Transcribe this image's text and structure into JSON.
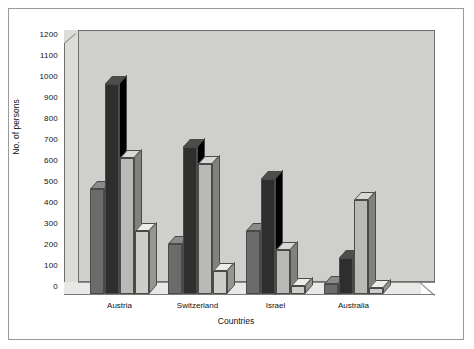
{
  "chart_data": {
    "type": "bar",
    "title": "",
    "xlabel": "Countries",
    "ylabel": "No. of persons",
    "categories": [
      "Austria",
      "Switzerland",
      "Israel",
      "Australia"
    ],
    "ylim": [
      0,
      1200
    ],
    "yticks": [
      0,
      100,
      200,
      300,
      400,
      500,
      600,
      700,
      800,
      900,
      1000,
      1100,
      1200
    ],
    "grid": false,
    "legend": "none",
    "style": "3d-clustered-column",
    "series": [
      {
        "name": "Series 1",
        "color": "#6b6b6b",
        "values": [
          500,
          240,
          300,
          50
        ]
      },
      {
        "name": "Series 2",
        "color": "#2e2e2e",
        "values": [
          1000,
          700,
          550,
          170
        ]
      },
      {
        "name": "Series 3",
        "color": "#b9b9b5",
        "values": [
          650,
          620,
          210,
          450
        ]
      },
      {
        "name": "Series 4",
        "color": "#cdcdc9",
        "values": [
          300,
          110,
          40,
          30
        ]
      }
    ]
  },
  "axes": {
    "y_title": "No. of persons",
    "x_title": "Countries",
    "y_tick_labels": [
      "0",
      "100",
      "200",
      "300",
      "400",
      "500",
      "600",
      "700",
      "800",
      "900",
      "1000",
      "1100",
      "1200"
    ],
    "x_tick_labels": [
      "Austria",
      "Switzerland",
      "Israel",
      "Australia"
    ]
  },
  "colors": {
    "plot_background": "#cfcfcb",
    "page_background": "#ffffff",
    "frame_border": "#9a9a9a",
    "axis_line": "#6f6f6f",
    "text": "#111111"
  }
}
